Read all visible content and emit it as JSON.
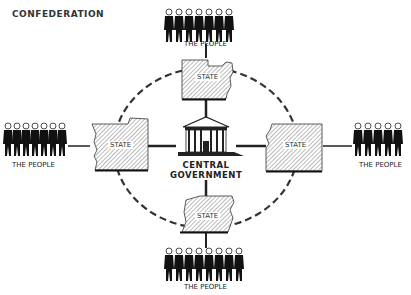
{
  "title": "CONFEDERATION",
  "center": {
    "label_line1": "CENTRAL",
    "label_line2": "GOVERNMENT"
  },
  "states": [
    {
      "position": "top",
      "label": "STATE"
    },
    {
      "position": "left",
      "label": "STATE"
    },
    {
      "position": "right",
      "label": "STATE"
    },
    {
      "position": "bottom",
      "label": "STATE"
    }
  ],
  "people": [
    {
      "position": "top",
      "label": "THE PEOPLE"
    },
    {
      "position": "left",
      "label": "THE PEOPLE"
    },
    {
      "position": "right",
      "label": "THE PEOPLE"
    },
    {
      "position": "bottom",
      "label": "THE PEOPLE"
    }
  ],
  "colors": {
    "ink": "#222222",
    "hatch": "#666666",
    "background": "#ffffff"
  }
}
